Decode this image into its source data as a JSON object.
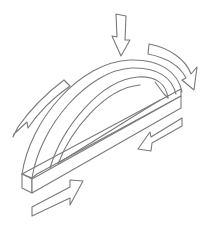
{
  "diagram": {
    "stroke_color": "#7a7a7a",
    "background": "#ffffff",
    "elements": [
      {
        "name": "arch",
        "description": "curved arch member resting on a straight base beam, drawn in isometric view"
      },
      {
        "name": "base-beam",
        "description": "straight rectangular beam forming the tie of the arch"
      },
      {
        "name": "down-arrow",
        "description": "vertical load arrow pointing down onto the arch crown"
      },
      {
        "name": "curved-arrow-right",
        "description": "curved arrow following the arch toward the right support"
      },
      {
        "name": "curved-arrow-left",
        "description": "curved arrow following the arch toward the left support"
      },
      {
        "name": "arrow-inward-right",
        "description": "arrow along the beam pointing toward the center from the right end"
      },
      {
        "name": "arrow-inward-left",
        "description": "arrow along the beam pointing toward the center from the left end"
      }
    ]
  }
}
